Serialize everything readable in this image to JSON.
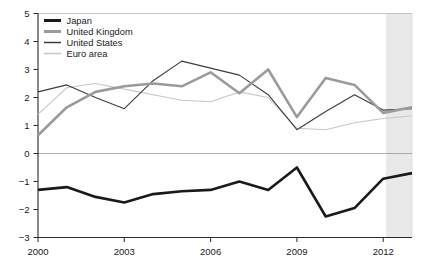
{
  "chart_data": {
    "type": "line",
    "x": [
      2000,
      2001,
      2002,
      2003,
      2004,
      2005,
      2006,
      2007,
      2008,
      2009,
      2010,
      2011,
      2012,
      2013
    ],
    "series": [
      {
        "name": "Japan",
        "color": "#1a1a1a",
        "stroke_width": 2.6,
        "values": [
          -1.3,
          -1.2,
          -1.55,
          -1.75,
          -1.45,
          -1.35,
          -1.3,
          -1.0,
          -1.3,
          -0.5,
          -2.25,
          -1.95,
          -0.9,
          -0.7
        ]
      },
      {
        "name": "United Kingdom",
        "color": "#9b9b9b",
        "stroke_width": 2.6,
        "values": [
          0.65,
          1.65,
          2.2,
          2.4,
          2.5,
          2.4,
          2.9,
          2.15,
          3.0,
          1.3,
          2.7,
          2.45,
          1.45,
          1.65
        ]
      },
      {
        "name": "United States",
        "color": "#3c3c3c",
        "stroke_width": 1.1,
        "values": [
          2.2,
          2.45,
          2.0,
          1.6,
          2.6,
          3.3,
          3.05,
          2.8,
          2.1,
          0.85,
          1.5,
          2.1,
          1.55,
          1.6
        ]
      },
      {
        "name": "Euro area",
        "color": "#c6c6c6",
        "stroke_width": 1.1,
        "values": [
          1.4,
          2.35,
          2.5,
          2.3,
          2.1,
          1.9,
          1.85,
          2.2,
          2.0,
          0.9,
          0.85,
          1.1,
          1.25,
          1.35
        ]
      }
    ],
    "title": "",
    "xlabel": "",
    "ylabel": "",
    "xlim": [
      2000,
      2013
    ],
    "ylim": [
      -3,
      5
    ],
    "yticks": [
      5,
      4,
      3,
      2,
      1,
      0,
      -1,
      -2,
      -3
    ],
    "ytick_labels": [
      "5",
      "4",
      "3",
      "2",
      "1",
      "0",
      "−1",
      "−2",
      "−3"
    ],
    "xticks": [
      2000,
      2003,
      2006,
      2009,
      2012
    ],
    "xtick_labels": [
      "2000",
      "2003",
      "2006",
      "2009",
      "2012"
    ],
    "grid": false,
    "zero_line": true,
    "legend_position": "top-left",
    "legend_labels": [
      "Japan",
      "United Kingdom",
      "United States",
      "Euro area"
    ],
    "shaded_region": {
      "from": 2012.1,
      "to": 2013,
      "color": "#e9e9e9"
    },
    "colors": {
      "axis": "#2b2b2b",
      "frame_top": "#b3b3b3",
      "frame_right": "#d9d9d9",
      "zero_line": "#999999",
      "background": "#ffffff"
    }
  }
}
